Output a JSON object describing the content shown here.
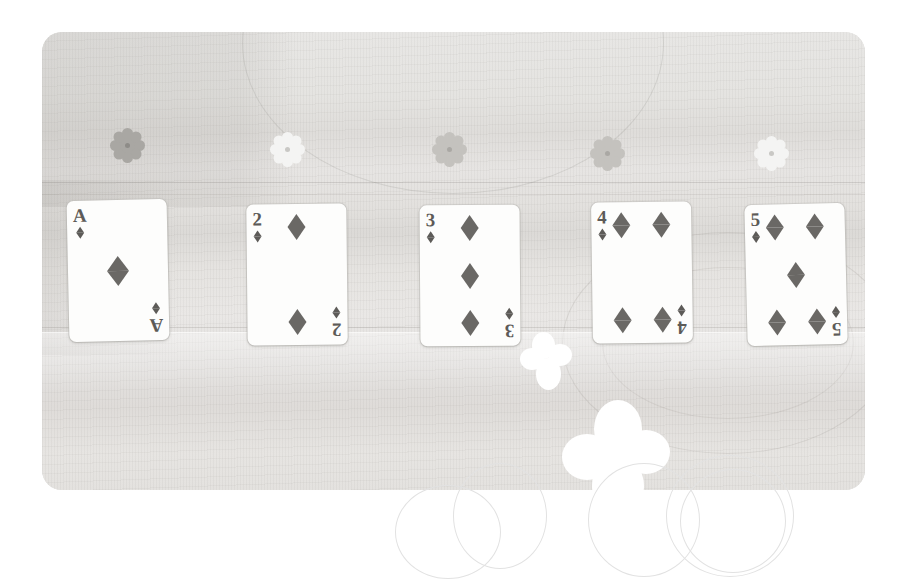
{
  "scene": {
    "description": "Photograph of five diamond playing cards laid on a wooden table with flower-shaped beads above them",
    "background_color": "#ffffff",
    "photo": {
      "surface": "wood table",
      "surface_color": "#e4e3e1",
      "corner_radius": "20px"
    }
  },
  "beads": [
    {
      "id": "bead-1",
      "shape": "flower",
      "color": "#a9a7a3",
      "tone": "dark"
    },
    {
      "id": "bead-2",
      "shape": "flower",
      "color": "#f4f4f3",
      "tone": "light"
    },
    {
      "id": "bead-3",
      "shape": "flower",
      "color": "#c4c2be",
      "tone": "mid"
    },
    {
      "id": "bead-4",
      "shape": "flower",
      "color": "#c4c2be",
      "tone": "mid"
    },
    {
      "id": "bead-5",
      "shape": "flower",
      "color": "#f4f4f3",
      "tone": "light"
    }
  ],
  "cards": [
    {
      "rank": "A",
      "suit": "diamonds",
      "suit_symbol": "♦",
      "count": 1,
      "name": "ace-of-diamonds"
    },
    {
      "rank": "2",
      "suit": "diamonds",
      "suit_symbol": "♦",
      "count": 2,
      "name": "two-of-diamonds"
    },
    {
      "rank": "3",
      "suit": "diamonds",
      "suit_symbol": "♦",
      "count": 3,
      "name": "three-of-diamonds"
    },
    {
      "rank": "4",
      "suit": "diamonds",
      "suit_symbol": "♦",
      "count": 4,
      "name": "four-of-diamonds"
    },
    {
      "rank": "5",
      "suit": "diamonds",
      "suit_symbol": "♦",
      "count": 5,
      "name": "five-of-diamonds"
    }
  ],
  "butterflies": [
    {
      "id": "butterfly-small",
      "fill": "#ffffff",
      "style": "solid"
    },
    {
      "id": "butterfly-large",
      "fill": "#ffffff",
      "style": "solid"
    },
    {
      "id": "butterfly-outline-left",
      "fill": "none",
      "style": "outline"
    },
    {
      "id": "butterfly-outline-right",
      "fill": "none",
      "style": "outline"
    }
  ]
}
